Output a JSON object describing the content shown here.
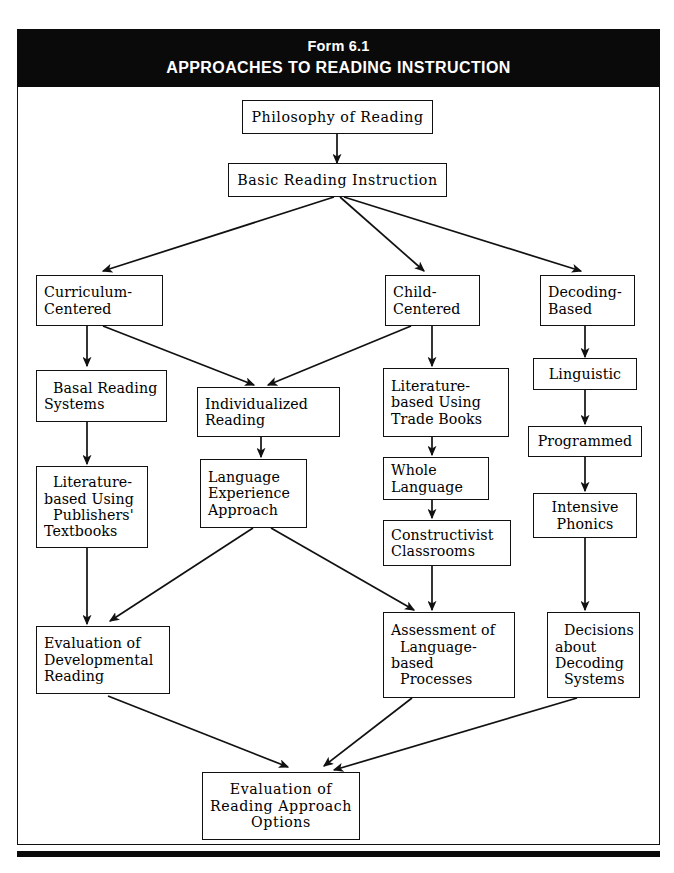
{
  "header": {
    "form_number": "Form 6.1",
    "title": "APPROACHES TO READING INSTRUCTION",
    "background_color": "#0a0a0a",
    "text_color": "#ffffff"
  },
  "diagram": {
    "type": "flowchart",
    "orientation": "top-down",
    "border_color": "#111111",
    "nodes": {
      "philosophy": {
        "label": "Philosophy of Reading",
        "lines": [
          "Philosophy of Reading"
        ]
      },
      "basic": {
        "label": "Basic Reading Instruction",
        "lines": [
          "Basic Reading Instruction"
        ]
      },
      "curriculum": {
        "label": "Curriculum-Centered",
        "lines": [
          "Curriculum-",
          "Centered"
        ]
      },
      "child": {
        "label": "Child-Centered",
        "lines": [
          "Child-",
          "Centered"
        ]
      },
      "decoding": {
        "label": "Decoding-Based",
        "lines": [
          "Decoding-",
          "Based"
        ]
      },
      "basal": {
        "label": "Basal Reading Systems",
        "lines": [
          "Basal Reading",
          "Systems"
        ]
      },
      "individualized": {
        "label": "Individualized Reading",
        "lines": [
          "Individualized",
          "Reading"
        ]
      },
      "lit_trade": {
        "label": "Literature-based Using Trade Books",
        "lines": [
          "Literature-",
          "based Using",
          "Trade Books"
        ]
      },
      "linguistic": {
        "label": "Linguistic",
        "lines": [
          "Linguistic"
        ]
      },
      "lit_pub": {
        "label": "Literature-based Using Publishers' Textbooks",
        "lines": [
          "Literature-",
          "based Using",
          "Publishers'",
          "Textbooks"
        ]
      },
      "language_exp": {
        "label": "Language Experience Approach",
        "lines": [
          "Language",
          "Experience",
          "Approach"
        ]
      },
      "whole_language": {
        "label": "Whole Language",
        "lines": [
          "Whole",
          "Language"
        ]
      },
      "programmed": {
        "label": "Programmed",
        "lines": [
          "Programmed"
        ]
      },
      "constructivist": {
        "label": "Constructivist Classrooms",
        "lines": [
          "Constructivist",
          "Classrooms"
        ]
      },
      "intensive": {
        "label": "Intensive Phonics",
        "lines": [
          "Intensive",
          "Phonics"
        ]
      },
      "eval_dev": {
        "label": "Evaluation of Developmental Reading",
        "lines": [
          "Evaluation of",
          "Developmental",
          "Reading"
        ]
      },
      "assessment": {
        "label": "Assessment of Language-based Processes",
        "lines": [
          "Assessment of",
          "Language-",
          "based",
          "Processes"
        ]
      },
      "decisions": {
        "label": "Decisions about Decoding Systems",
        "lines": [
          "Decisions",
          "about",
          "Decoding",
          "Systems"
        ]
      },
      "eval_options": {
        "label": "Evaluation of Reading Approach Options",
        "lines": [
          "Evaluation of",
          "Reading Approach",
          "Options"
        ]
      }
    },
    "edges": [
      {
        "from": "philosophy",
        "to": "basic"
      },
      {
        "from": "basic",
        "to": "curriculum"
      },
      {
        "from": "basic",
        "to": "child"
      },
      {
        "from": "basic",
        "to": "decoding"
      },
      {
        "from": "curriculum",
        "to": "basal"
      },
      {
        "from": "curriculum",
        "to": "individualized"
      },
      {
        "from": "child",
        "to": "individualized"
      },
      {
        "from": "child",
        "to": "lit_trade"
      },
      {
        "from": "decoding",
        "to": "linguistic"
      },
      {
        "from": "basal",
        "to": "lit_pub"
      },
      {
        "from": "individualized",
        "to": "language_exp"
      },
      {
        "from": "lit_trade",
        "to": "whole_language"
      },
      {
        "from": "linguistic",
        "to": "programmed"
      },
      {
        "from": "whole_language",
        "to": "constructivist"
      },
      {
        "from": "programmed",
        "to": "intensive"
      },
      {
        "from": "lit_pub",
        "to": "eval_dev"
      },
      {
        "from": "language_exp",
        "to": "eval_dev"
      },
      {
        "from": "language_exp",
        "to": "assessment"
      },
      {
        "from": "constructivist",
        "to": "assessment"
      },
      {
        "from": "intensive",
        "to": "decisions"
      },
      {
        "from": "eval_dev",
        "to": "eval_options"
      },
      {
        "from": "assessment",
        "to": "eval_options"
      },
      {
        "from": "decisions",
        "to": "eval_options"
      }
    ]
  }
}
